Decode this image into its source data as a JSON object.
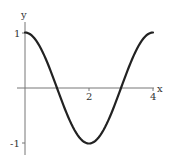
{
  "chart_data": {
    "type": "line",
    "title": "",
    "xlabel": "x",
    "ylabel": "y",
    "xlim": [
      0,
      4
    ],
    "ylim": [
      -1.2,
      1.15
    ],
    "grid": false,
    "legend": null,
    "x_ticks": [
      "2",
      "4"
    ],
    "y_ticks": [
      "1",
      "-1"
    ],
    "series": [
      {
        "name": "cos(pi x / 2)",
        "x": [
          0,
          0.25,
          0.5,
          0.75,
          1,
          1.25,
          1.5,
          1.75,
          2,
          2.25,
          2.5,
          2.75,
          3,
          3.25,
          3.5,
          3.75,
          4
        ],
        "values": [
          1,
          0.924,
          0.707,
          0.383,
          0,
          -0.383,
          -0.707,
          -0.924,
          -1,
          -0.924,
          -0.707,
          -0.383,
          0,
          0.383,
          0.707,
          0.924,
          1
        ]
      }
    ]
  },
  "labels": {
    "x_axis": "x",
    "y_axis": "y",
    "xtick_2": "2",
    "xtick_4": "4",
    "ytick_1": "1",
    "ytick_m1": "-1"
  }
}
